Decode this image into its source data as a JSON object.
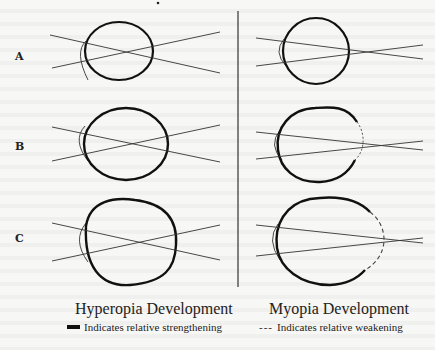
{
  "rows": [
    {
      "label": "A"
    },
    {
      "label": "B"
    },
    {
      "label": "C"
    }
  ],
  "columns": {
    "left": {
      "title": "Hyperopia Development",
      "legend_symbol": "solid-thick-line",
      "legend_text": "Indicates relative strengthening"
    },
    "right": {
      "title": "Myopia Development",
      "legend_symbol": "---",
      "legend_text": "Indicates relative weakening"
    }
  },
  "colors": {
    "background": "#f7f7f5",
    "stroke": "#111111",
    "ray": "#333333"
  }
}
